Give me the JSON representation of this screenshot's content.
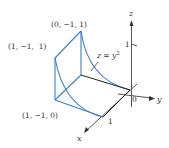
{
  "figure": {
    "surface_label": "z = y",
    "surface_exponent": "2",
    "axes": {
      "x": "x",
      "y": "y",
      "z": "z",
      "origin": "0",
      "x_tick": "1",
      "z_tick": "1"
    },
    "points": [
      {
        "label": "(0, −1, 1)"
      },
      {
        "label": "(1, −1,  1)"
      },
      {
        "label": "(1, −1, 0)"
      }
    ],
    "colors": {
      "surface_edges": "#3a7fd0",
      "axes": "#444444",
      "text": "#333333"
    }
  }
}
